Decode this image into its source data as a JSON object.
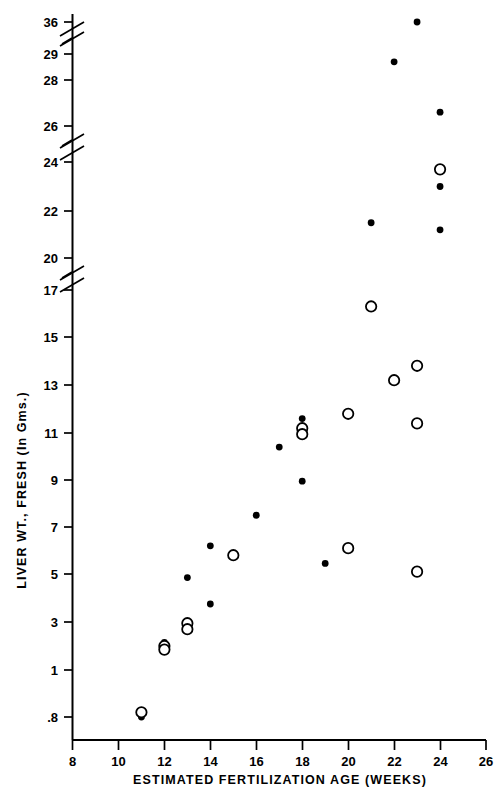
{
  "figure": {
    "background": "#ffffff",
    "ink_color": "#000000"
  },
  "chart_data": {
    "type": "scatter",
    "title": "",
    "xlabel": "ESTIMATED  FERTILIZATION  AGE  (WEEKS)",
    "ylabel": "LIVER  WT.,  FRESH  (In Gms.)",
    "xlim": [
      8,
      26
    ],
    "ylim": [
      0.8,
      36
    ],
    "grid": false,
    "legend_position": "none",
    "x_ticks": [
      8,
      10,
      12,
      14,
      16,
      18,
      20,
      22,
      24,
      26
    ],
    "x_tick_labels": [
      "8",
      "10",
      "12",
      "14",
      "16",
      "18",
      "20",
      "22",
      "24",
      "26"
    ],
    "y_ticks": [
      0.8,
      1,
      3,
      5,
      7,
      9,
      11,
      13,
      15,
      17,
      20,
      22,
      24,
      26,
      28,
      29,
      36
    ],
    "y_tick_labels": [
      ".8",
      "1",
      "3",
      "5",
      "7",
      "9",
      "11",
      "13",
      "15",
      "17",
      "20",
      "22",
      "24",
      "26",
      "28",
      "29",
      "36"
    ],
    "y_axis_breaks": [
      {
        "between": [
          17,
          20
        ],
        "note": "axis-break-zigzag"
      },
      {
        "between": [
          24,
          26
        ],
        "note": "axis-break-zigzag"
      },
      {
        "between": [
          29,
          36
        ],
        "note": "axis-break-zigzag"
      }
    ],
    "series": [
      {
        "name": "filled-circle",
        "marker": "filled circle",
        "points": [
          {
            "x": 11.0,
            "y": 0.72
          },
          {
            "x": 12.0,
            "y": 2.15
          },
          {
            "x": 13.0,
            "y": 2.9
          },
          {
            "x": 14.0,
            "y": 3.75
          },
          {
            "x": 13.0,
            "y": 4.85
          },
          {
            "x": 14.0,
            "y": 6.2
          },
          {
            "x": 16.0,
            "y": 7.5
          },
          {
            "x": 18.0,
            "y": 8.95
          },
          {
            "x": 17.0,
            "y": 10.4
          },
          {
            "x": 18.0,
            "y": 11.6
          },
          {
            "x": 19.0,
            "y": 5.45
          },
          {
            "x": 20.0,
            "y": 11.8
          },
          {
            "x": 21.0,
            "y": 21.5
          },
          {
            "x": 22.0,
            "y": 28.7
          },
          {
            "x": 23.0,
            "y": 36.2
          },
          {
            "x": 24.0,
            "y": 26.6
          },
          {
            "x": 24.0,
            "y": 23.0
          },
          {
            "x": 24.0,
            "y": 21.2
          }
        ]
      },
      {
        "name": "open-circle",
        "marker": "open circle",
        "points": [
          {
            "x": 11.0,
            "y": 0.82
          },
          {
            "x": 12.0,
            "y": 2.0
          },
          {
            "x": 12.0,
            "y": 1.85
          },
          {
            "x": 13.0,
            "y": 2.95
          },
          {
            "x": 13.0,
            "y": 2.7
          },
          {
            "x": 15.0,
            "y": 5.8
          },
          {
            "x": 18.0,
            "y": 11.2
          },
          {
            "x": 18.0,
            "y": 10.95
          },
          {
            "x": 20.0,
            "y": 11.8
          },
          {
            "x": 20.0,
            "y": 6.1
          },
          {
            "x": 21.0,
            "y": 16.3
          },
          {
            "x": 22.0,
            "y": 13.2
          },
          {
            "x": 23.0,
            "y": 13.8
          },
          {
            "x": 23.0,
            "y": 11.4
          },
          {
            "x": 23.0,
            "y": 5.1
          },
          {
            "x": 24.0,
            "y": 23.7
          }
        ]
      }
    ]
  }
}
